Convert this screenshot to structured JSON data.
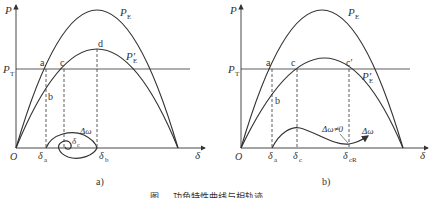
{
  "panels": [
    {
      "id": "a",
      "caption": "a)",
      "axis": {
        "y_label": "P",
        "x_label": "δ",
        "origin": "O"
      },
      "curves": {
        "pe": "P",
        "pe_sub": "E",
        "pe_prime": "P′",
        "pe_prime_sub": "E"
      },
      "pt_label": "P",
      "pt_sub": "T",
      "points": {
        "a": "a",
        "b": "b",
        "c": "c",
        "d": "d"
      },
      "deltas": {
        "a_main": "δ",
        "a_sub": "a",
        "c_main": "δ",
        "c_sub": "c",
        "b_main": "δ",
        "b_sub": "b"
      },
      "trajectory_label": "Δω"
    },
    {
      "id": "b",
      "caption": "b)",
      "axis": {
        "y_label": "P",
        "x_label": "δ",
        "origin": "O"
      },
      "curves": {
        "pe": "P",
        "pe_sub": "E",
        "pe_prime": "P′",
        "pe_prime_sub": "E"
      },
      "pt_label": "P",
      "pt_sub": "T",
      "points": {
        "a": "a",
        "b": "b",
        "c": "c",
        "c_prime": "c′"
      },
      "deltas": {
        "a_main": "δ",
        "a_sub": "a",
        "c_main": "δ",
        "c_sub": "c",
        "cr_main": "δ",
        "cr_sub": "cR"
      },
      "trajectory_label": "Δω",
      "annotation": "Δω≠0"
    }
  ],
  "figure_caption": "图 … 功角特性曲线与相轨迹"
}
